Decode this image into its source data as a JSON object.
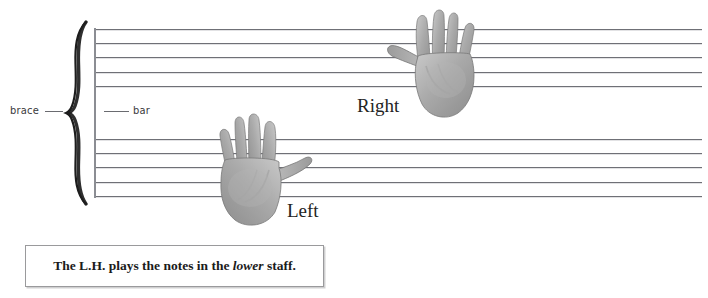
{
  "figure": {
    "kind": "music-notation-grand-staff-diagram",
    "background_color": "#ffffff"
  },
  "staff_system": {
    "staff_line_color": "#6f7076",
    "bar_line_color": "#8b8d93",
    "upper_staff": {
      "name": "upper-staff",
      "line_count": 5
    },
    "lower_staff": {
      "name": "lower-staff",
      "line_count": 5
    }
  },
  "callouts": [
    {
      "label": "brace",
      "target": "brace"
    },
    {
      "label": "bar",
      "target": "bar-line"
    }
  ],
  "callout_labels": {
    "brace": "brace",
    "bar": "bar"
  },
  "hands": {
    "right": {
      "label": "Right",
      "description": "right-hand-photo"
    },
    "left": {
      "label": "Left",
      "description": "left-hand-photo"
    }
  },
  "caption": {
    "prefix": "The L.H. plays the notes in the ",
    "emphasis": "lower",
    "suffix": " staff.",
    "full_text": "The L.H. plays the notes in the lower staff.",
    "border_color": "#9a9a9c"
  }
}
